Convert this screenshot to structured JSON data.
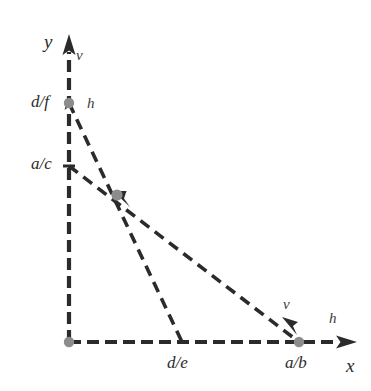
{
  "figure": {
    "background_color": "#ffffff",
    "line_color": "#2b2b2b",
    "point_color": "#8c8c8c",
    "label_color": "#2b2b2b",
    "width": 371,
    "height": 391
  },
  "axes": {
    "x": {
      "label": "x",
      "label_position": {
        "x": 346,
        "y": 370
      },
      "origin": {
        "x": 69,
        "y": 342
      },
      "tip": {
        "x": 355,
        "y": 342
      }
    },
    "y": {
      "label": "y",
      "label_position": {
        "x": 44,
        "y": 47
      },
      "origin": {
        "x": 69,
        "y": 342
      },
      "tip": {
        "x": 69,
        "y": 36
      }
    }
  },
  "points": [
    {
      "name": "origin-point",
      "label": "",
      "x": 69,
      "y": 342,
      "marker": "dot"
    },
    {
      "name": "y-intercept-df",
      "label": "d/f",
      "label_position": {
        "x": 31,
        "y": 95
      },
      "x": 69,
      "y": 103,
      "marker": "dot"
    },
    {
      "name": "y-intercept-ac",
      "label": "a/c",
      "label_position": {
        "x": 31,
        "y": 157
      },
      "x": 69,
      "y": 166,
      "marker": "tick"
    },
    {
      "name": "x-intercept-de",
      "label": "d/e",
      "label_position": {
        "x": 167,
        "y": 356
      },
      "x": 182,
      "y": 342,
      "marker": "none"
    },
    {
      "name": "x-intercept-ab",
      "label": "a/b",
      "label_position": {
        "x": 285,
        "y": 356
      },
      "x": 299,
      "y": 342,
      "marker": "dot"
    },
    {
      "name": "intersection-point",
      "label": "",
      "x": 117,
      "y": 195,
      "marker": "dot"
    }
  ],
  "constraint_lines": [
    {
      "name": "line-h",
      "label": "h",
      "from": {
        "x": 69,
        "y": 103
      },
      "to": {
        "x": 182,
        "y": 342
      },
      "style": "dashed"
    },
    {
      "name": "line-v",
      "label": "v",
      "from": {
        "x": 69,
        "y": 166
      },
      "to": {
        "x": 299,
        "y": 342
      },
      "style": "dashed"
    }
  ],
  "edge_labels": [
    {
      "name": "v-label-y-axis",
      "text": "v",
      "x": 76,
      "y": 55
    },
    {
      "name": "h-label-upper",
      "text": "h",
      "x": 87,
      "y": 103
    },
    {
      "name": "v-label-lower",
      "text": "v",
      "x": 283,
      "y": 304
    },
    {
      "name": "h-label-x-axis",
      "text": "h",
      "x": 329,
      "y": 318
    }
  ]
}
